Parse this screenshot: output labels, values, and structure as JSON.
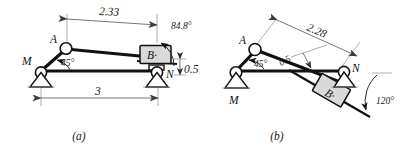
{
  "figure": {
    "colors": {
      "line": "#111111",
      "block_fill": "#d9d9d9",
      "dimension": "#4a4a4a",
      "extension": "#8c8c8c",
      "background": "#ffffff"
    }
  },
  "panels": [
    {
      "id": "a",
      "caption": "(a)",
      "joints": [
        {
          "name": "A",
          "label": "A"
        },
        {
          "name": "M",
          "label": "M"
        },
        {
          "name": "N",
          "label": "N"
        },
        {
          "name": "B",
          "label": "B·"
        }
      ],
      "dimensions": [
        {
          "name": "top-horizontal",
          "value": "2.33"
        },
        {
          "name": "bottom-span",
          "value": "3"
        },
        {
          "name": "offset-vertical",
          "value": "0.5"
        }
      ],
      "angles": [
        {
          "name": "crank-angle",
          "value": "45°"
        },
        {
          "name": "slider-axis-angle",
          "value": "84.8°"
        }
      ]
    },
    {
      "id": "b",
      "caption": "(b)",
      "joints": [
        {
          "name": "A",
          "label": "A"
        },
        {
          "name": "M",
          "label": "M"
        },
        {
          "name": "N",
          "label": "N"
        },
        {
          "name": "B",
          "label": "B·"
        }
      ],
      "dimensions": [
        {
          "name": "inclined-span",
          "value": "2.28"
        },
        {
          "name": "offset-perpendicular",
          "value": "0.5"
        }
      ],
      "angles": [
        {
          "name": "crank-angle",
          "value": "45°"
        },
        {
          "name": "slider-axis-angle",
          "value": "120°"
        }
      ]
    }
  ]
}
